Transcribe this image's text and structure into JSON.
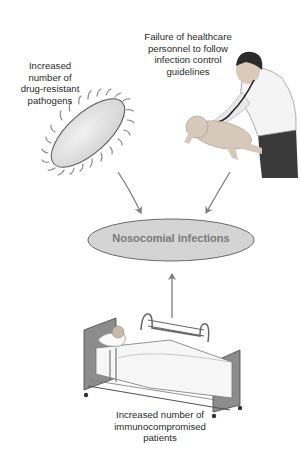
{
  "diagram": {
    "center_node": {
      "label": "Nosocomial infections",
      "fill": "#d4d4d4",
      "text_color": "#7a7a7a"
    },
    "causes": [
      {
        "id": "pathogens",
        "lines": [
          "Increased",
          "number of",
          "drug-resistant",
          "pathogens"
        ],
        "illustration": "bacterium-icon"
      },
      {
        "id": "personnel",
        "lines": [
          "Failure of healthcare",
          "personnel to follow",
          "infection control",
          "guidelines"
        ],
        "illustration": "doctor-examining-infant"
      },
      {
        "id": "patients",
        "lines": [
          "Increased number of",
          "immunocompromised",
          "patients"
        ],
        "illustration": "hospital-bed-patient"
      }
    ],
    "arrow_color": "#7d7d7d"
  }
}
